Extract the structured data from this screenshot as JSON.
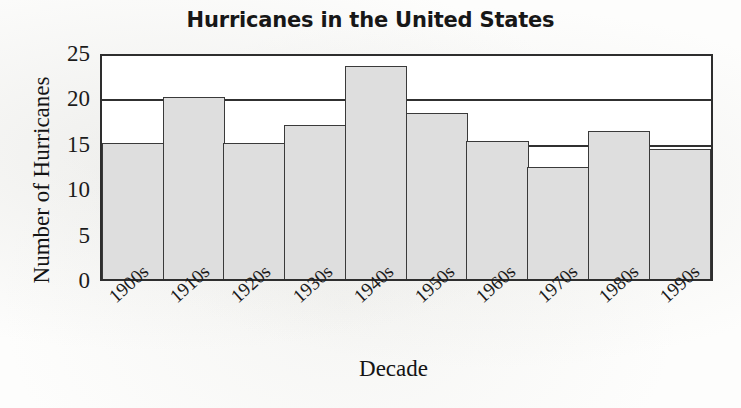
{
  "chart_data": {
    "type": "bar",
    "title": "Hurricanes in the United States",
    "xlabel": "Decade",
    "ylabel": "Number of Hurricanes",
    "categories": [
      "1900s",
      "1910s",
      "1920s",
      "1930s",
      "1940s",
      "1950s",
      "1960s",
      "1970s",
      "1980s",
      "1990s"
    ],
    "values": [
      15,
      20,
      15,
      17,
      23.5,
      18.3,
      15.2,
      12.3,
      16.3,
      14.3
    ],
    "ylim": [
      0,
      25
    ],
    "yticks": [
      0,
      5,
      10,
      15,
      20,
      25
    ],
    "gridlines": [
      15,
      20,
      25
    ],
    "grid": true,
    "legend": null,
    "colors": {
      "bar_fill": "#dedede",
      "bar_stroke": "#3a3a3a",
      "axis": "#2e2e2e",
      "text": "#1b1b1b",
      "background": "#ffffff"
    }
  }
}
